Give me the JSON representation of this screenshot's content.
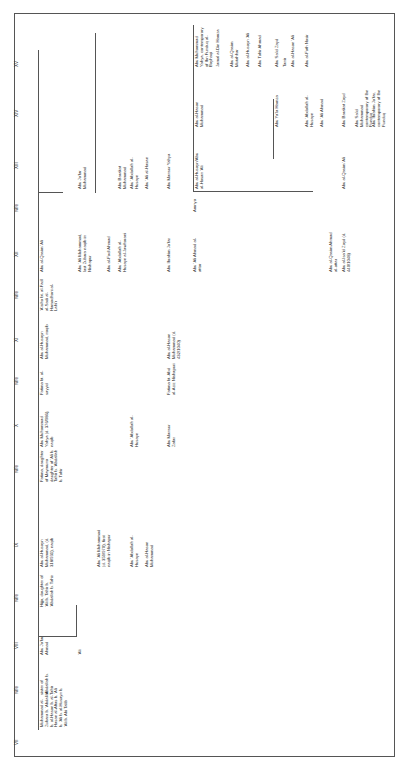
{
  "headers": [
    "VII",
    "wife",
    "VIII",
    "wife",
    "IX",
    "wife",
    "X",
    "wife",
    "XI",
    "wife",
    "XII",
    "wife",
    "XIII",
    "XIV",
    "XV"
  ],
  "nodes": {
    "vii_main": "Muhammad al-Zubara b. 'Abdallah b. al-Hasan b. al-Hasan al-Aftas b. 'Ali b. 'Ali b. al-Husayn b. 'Ali b. Abi Talib",
    "vii_wife": "sister of 'Abdallah b. Tahir",
    "viii_main": "Abu Ja'far Ahmad",
    "viii_ali": "'Ali",
    "viii_wife": "Hijja, daughter of 'Ali b. Tahir b. 'Abdallah b. Tahir",
    "ix_main": "Abu al-Husayn Muhammad, (d. 318/931), naqib",
    "ix_ali": "Abu 'Ali Muhammad (d. 359/970), first naqib in Nishapur",
    "ix_abdallah": "Abu 'Abdallah al-Husayn",
    "ix_hasan": "Abu al-Hasan Muhammad",
    "ix_wife": "Fatima, daughter of Maymuna daughter of 'Ali b. Tahir b. 'Abdallah b. Tahir",
    "x_main": "Abu Muhammad Yahya (d. 376/986), naqib",
    "x_abdallah": "Abu 'Abdallah al-Husayn",
    "x_mansur": "Abu Mansur Zafar",
    "x_wife": "Fatima bt. al-sayyid",
    "x_wife2": "Fatima bt. Abd al-Aziz Nishapuri",
    "xi_main": "Abu al-Husayn Muhammad, naqib",
    "xi_hasan": "Abu al-Hasan Muhammad (d. 432/1040)",
    "xi_wife": "'A'isha bt. al-Fadl al-Sadi al-Hamadhani al-Lahi'r",
    "xii_main": "Abu al-Qasim 'Ali",
    "xii_ali": "Abu 'Ali Muhammad, last Zubara naqib in Nishapur",
    "xii_fadl": "Abu al-Fadl Ahmad",
    "xii_abdallah": "Abu 'Abdallah al-Husayn al-Jawharani",
    "xii_ibrahim": "Abu Ibrahim Ja'far",
    "xii_ahmad": "Abu 'Ali Ahmad al-attar",
    "xii_qasim": "Abu al-Qasim Ahmad al-attar",
    "xii_isa": "Abu al-Isa'id Zayd (d. 440/1048)",
    "xii_wife": "Amnya",
    "xiii_jafar": "Abu Ja'far Muhammad",
    "xiii_barakat": "Abu Barakat Muhammad",
    "xiii_abdallah": "Abu 'Abdallah al-Husayn",
    "xiii_hasan": "Abu 'Ali al-Hasan",
    "xiii_mansur": "Abu Mansur Yahya",
    "xiii_husayn": "Abu al-Husayn/Abu al-Hasan 'Ali",
    "xiii_qasim": "Abu al-Qasim 'Ali",
    "xiv_hasan": "Abu al-Hasan Muhammad",
    "xiv_hamza": "Abu Ya'la Hamza",
    "xiv_abdallah": "Abu 'Abdallah al-Husayn",
    "xiv_ahmad": "Abu 'Ali Ahmad",
    "xiv_barakat": "Abu Barakat Zayd",
    "xiv_said": "Abu Sa'id Muhammad contemporary of Ibn Funduq",
    "xiv_ibrahim": "Abu Ibrahim Ja'far, contemporary of Ibn Funduq",
    "xv_yahya": "Abu Muhammad Yahya, contemporary of Ibn Funduq al-Bayhaqi",
    "xv_jamal": "Jamal al-Din Hamza",
    "xv_qasim": "Abu al-Qasim Mutahhar",
    "xv_husayn": "Abu al-Husayn 'Ali",
    "xv_tahir": "Abu Tahir Ahmad",
    "xv_zayd": "Abu Sa'id Zayd",
    "xv_tanir": "Tanir",
    "xv_hasan": "Abu al-Hasan 'Ali",
    "xv_fath": "Abu al-Fath Nasir"
  }
}
